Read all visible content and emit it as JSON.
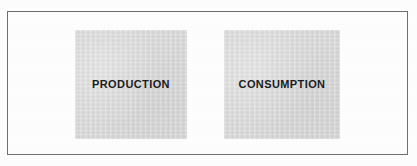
{
  "diagram": {
    "type": "block-diagram",
    "frame": {
      "border_color": "#6e6e6e",
      "background_color": "#ffffff"
    },
    "nodes": [
      {
        "id": "production",
        "label": "PRODUCTION",
        "fill_color": "#d9d9d9",
        "text_color": "#1b1b1b"
      },
      {
        "id": "consumption",
        "label": "CONSUMPTION",
        "fill_color": "#d9d9d9",
        "text_color": "#1b1b1b"
      }
    ]
  }
}
